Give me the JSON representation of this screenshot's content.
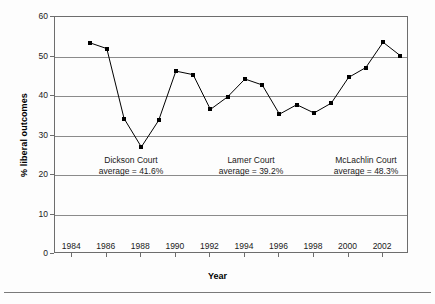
{
  "axes": {
    "ylabel": "% liberal outcomes",
    "xlabel": "Year",
    "yticks": [
      "0",
      "10",
      "20",
      "30",
      "40",
      "50",
      "60"
    ],
    "xticks": [
      "1984",
      "1986",
      "1988",
      "1990",
      "1992",
      "1994",
      "1996",
      "1998",
      "2000",
      "2002"
    ]
  },
  "annotations": [
    {
      "name": "dickson-court",
      "line1": "Dickson Court",
      "line2": "average = 41.6%"
    },
    {
      "name": "lamer-court",
      "line1": "Lamer Court",
      "line2": "average = 39.2%"
    },
    {
      "name": "mclachlin-court",
      "line1": "McLachlin Court",
      "line2": "average = 48.3%"
    }
  ],
  "chart_data": {
    "type": "line",
    "title": "",
    "xlabel": "Year",
    "ylabel": "% liberal outcomes",
    "xlim": [
      1983,
      2003.5
    ],
    "ylim": [
      0,
      60
    ],
    "grid": true,
    "legend": "none",
    "marker": "square",
    "line_color": "#000000",
    "marker_color": "#000000",
    "x": [
      1985,
      1986,
      1987,
      1988,
      1989,
      1990,
      1991,
      1992,
      1993,
      1994,
      1995,
      1996,
      1997,
      1998,
      1999,
      2000,
      2001,
      2002,
      2003
    ],
    "values": [
      53.5,
      52.0,
      34.3,
      27.1,
      33.8,
      46.3,
      45.4,
      36.6,
      39.8,
      44.3,
      42.8,
      35.4,
      37.8,
      35.7,
      38.2,
      44.7,
      47.2,
      53.6,
      50.2
    ],
    "series": [
      {
        "name": "% liberal outcomes",
        "values": [
          53.5,
          52.0,
          34.3,
          27.1,
          33.8,
          46.3,
          45.4,
          36.6,
          39.8,
          44.3,
          42.8,
          35.4,
          37.8,
          35.7,
          38.2,
          44.7,
          47.2,
          53.6,
          50.2
        ]
      }
    ],
    "annotations": [
      {
        "text": "Dickson Court average = 41.6%",
        "value": 41.6
      },
      {
        "text": "Lamer Court average = 39.2%",
        "value": 39.2
      },
      {
        "text": "McLachlin Court average = 48.3%",
        "value": 48.3
      }
    ]
  }
}
